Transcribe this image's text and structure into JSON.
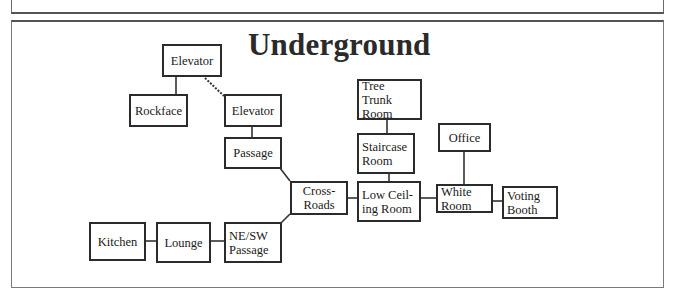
{
  "title": "Underground",
  "rooms": {
    "elevator_top": "Elevator",
    "rockface": "Rockface",
    "elevator_lower": "Elevator",
    "passage": "Passage",
    "cross_roads": "Cross-\nRoads",
    "low_ceiling_room": "Low Ceil-\ning Room",
    "tree_trunk_room": "Tree Trunk\nRoom",
    "staircase_room": "Staircase\nRoom",
    "office": "Office",
    "white_room": "White\nRoom",
    "voting_booth": "Voting\nBooth",
    "ne_sw_passage": "NE/SW\nPassage",
    "lounge": "Lounge",
    "kitchen": "Kitchen"
  },
  "connections": [
    {
      "from": "Elevator (top)",
      "to": "Rockface",
      "style": "solid"
    },
    {
      "from": "Elevator (top)",
      "to": "Elevator (lower)",
      "style": "dashed"
    },
    {
      "from": "Elevator (lower)",
      "to": "Passage",
      "style": "solid"
    },
    {
      "from": "Passage",
      "to": "Cross-Roads",
      "style": "solid"
    },
    {
      "from": "Cross-Roads",
      "to": "Low Ceiling Room",
      "style": "solid"
    },
    {
      "from": "Cross-Roads",
      "to": "NE/SW Passage",
      "style": "solid"
    },
    {
      "from": "Tree Trunk Room",
      "to": "Staircase Room",
      "style": "solid"
    },
    {
      "from": "Staircase Room",
      "to": "Low Ceiling Room",
      "style": "solid"
    },
    {
      "from": "Low Ceiling Room",
      "to": "White Room",
      "style": "solid"
    },
    {
      "from": "Office",
      "to": "White Room",
      "style": "solid"
    },
    {
      "from": "White Room",
      "to": "Voting Booth",
      "style": "solid"
    },
    {
      "from": "NE/SW Passage",
      "to": "Lounge",
      "style": "solid"
    },
    {
      "from": "Lounge",
      "to": "Kitchen",
      "style": "solid"
    }
  ]
}
